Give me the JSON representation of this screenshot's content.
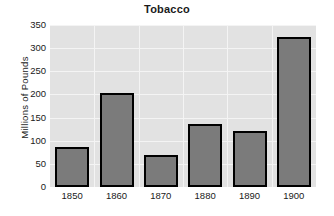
{
  "chart_data": {
    "type": "bar",
    "title": "Tobacco",
    "xlabel": "",
    "ylabel": "Millions of Pounds",
    "categories": [
      "1850",
      "1860",
      "1870",
      "1880",
      "1890",
      "1900"
    ],
    "values": [
      87,
      204,
      70,
      137,
      122,
      324
    ],
    "series": [
      {
        "name": "Tobacco",
        "values": [
          87,
          204,
          70,
          137,
          122,
          324
        ]
      }
    ],
    "ylim": [
      0,
      350
    ],
    "y_ticks": [
      "350",
      "300",
      "250",
      "200",
      "150",
      "100",
      "50",
      "0"
    ],
    "y_tick_values": [
      350,
      300,
      250,
      200,
      150,
      100,
      50,
      0
    ],
    "grid": true,
    "legend": "none",
    "colors": {
      "bar_fill": "#7b7b7b",
      "bar_edge": "#000000",
      "plot_background": "#e2e2e2",
      "gridline": "#f4f4f4",
      "text": "#1a1a1a",
      "figure_background": "#ffffff"
    }
  }
}
